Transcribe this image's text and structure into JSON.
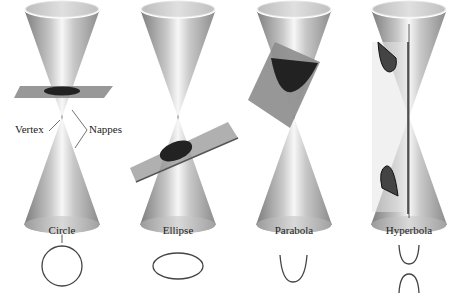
{
  "figure": {
    "axis_label": "Axis",
    "vertex_label": "Vertex",
    "nappes_label": "Nappes",
    "panels": [
      {
        "name": "circle",
        "label": "Circle"
      },
      {
        "name": "ellipse",
        "label": "Ellipse"
      },
      {
        "name": "parabola",
        "label": "Parabola"
      },
      {
        "name": "hyperbola",
        "label": "Hyperbola"
      }
    ]
  },
  "colors": {
    "cone_dark": "#8a8a8a",
    "cone_light": "#f2f2f2",
    "plane": "#8f8f8f",
    "section": "#2a2a2a",
    "curve": "#444444",
    "text": "#222222"
  }
}
